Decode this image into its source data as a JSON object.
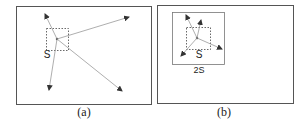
{
  "panels": [
    {
      "id": "a",
      "caption": "(a)",
      "box_label": "S",
      "description": "Dashed square S with a point emitting long arrows spreading across the whole frame"
    },
    {
      "id": "b",
      "caption": "(b)",
      "box_label": "S",
      "outer_label": "2S",
      "description": "Dashed square S inside a solid square 2S; arrows from the point stay within the 2S region"
    }
  ],
  "colors": {
    "frame": "#555555",
    "arrow": "#888888",
    "arrowhead": "#333333",
    "dashed": "#444444"
  }
}
